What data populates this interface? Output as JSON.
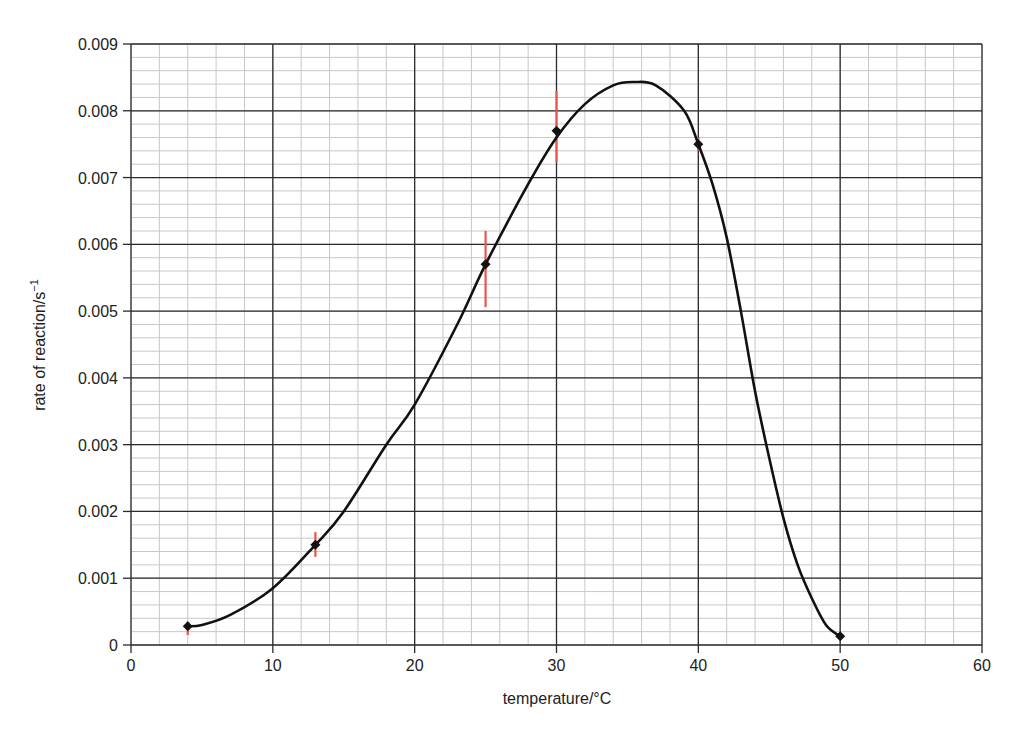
{
  "chart_data": {
    "type": "scatter",
    "title": "",
    "xlabel": "temperature/°C",
    "ylabel_main": "rate of reaction/s",
    "ylabel_superscript": "−1",
    "xlim": [
      0,
      60
    ],
    "ylim": [
      0,
      0.009
    ],
    "x_major_step": 10,
    "x_minor_step": 2,
    "y_major_step": 0.001,
    "y_minor_step": 0.0002,
    "grid": true,
    "x_ticks": [
      "0",
      "10",
      "20",
      "30",
      "40",
      "50",
      "60"
    ],
    "y_ticks": [
      "0",
      "0.001",
      "0.002",
      "0.003",
      "0.004",
      "0.005",
      "0.006",
      "0.007",
      "0.008",
      "0.009"
    ],
    "points": [
      {
        "x": 4,
        "y": 0.00028,
        "err_low": 0.00015,
        "err_high": 0.00035
      },
      {
        "x": 13,
        "y": 0.0015,
        "err_low": 0.00132,
        "err_high": 0.00169
      },
      {
        "x": 25,
        "y": 0.0057,
        "err_low": 0.00506,
        "err_high": 0.0062
      },
      {
        "x": 30,
        "y": 0.0077,
        "err_low": 0.00723,
        "err_high": 0.0083
      },
      {
        "x": 40,
        "y": 0.0075,
        "err_low": 0.0074,
        "err_high": 0.0076
      },
      {
        "x": 50,
        "y": 0.00013,
        "err_low": null,
        "err_high": null
      }
    ],
    "best_fit_curve": {
      "x": [
        4,
        5,
        7,
        10,
        13,
        15,
        18,
        20,
        23,
        25,
        28,
        30,
        32,
        34,
        35.5,
        37,
        39,
        40,
        41,
        42,
        43,
        44,
        45,
        46,
        47,
        48,
        49,
        50
      ],
      "y": [
        0.00028,
        0.0003,
        0.00045,
        0.00085,
        0.0015,
        0.002,
        0.003,
        0.0036,
        0.0048,
        0.0057,
        0.0069,
        0.0076,
        0.0081,
        0.00838,
        0.00843,
        0.00838,
        0.008,
        0.0075,
        0.0069,
        0.0061,
        0.005,
        0.0038,
        0.0028,
        0.0019,
        0.0012,
        0.0007,
        0.0003,
        0.00013
      ]
    },
    "colors": {
      "major_grid": "#2b2b2b",
      "minor_grid": "#c8c8c8",
      "curve": "#111111",
      "marker": "#111111",
      "error_bar": "#e8554a"
    }
  }
}
